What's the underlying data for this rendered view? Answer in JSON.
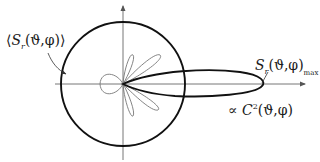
{
  "diagram": {
    "type": "polar-radiation-pattern",
    "labels": {
      "average": {
        "open": "⟨",
        "symbol": "S",
        "subscript": "r",
        "args": "(ϑ,φ)",
        "close": "⟩"
      },
      "maximum": {
        "symbol": "S",
        "subscript": "r",
        "args": "(ϑ,φ)",
        "suffix": "max"
      },
      "proportional": {
        "prefix": "∝ ",
        "symbol": "C",
        "superscript": "2",
        "args": "(ϑ,φ)"
      }
    },
    "elements": [
      "vertical-axis-with-arrow",
      "horizontal-axis-with-arrow",
      "average-power-circle",
      "main-lobe",
      "back-lobe",
      "upper-side-lobes",
      "lower-side-lobes",
      "leader-arrow-to-circle",
      "leader-line-to-main-lobe-tip"
    ],
    "colors": {
      "heavy_stroke": "#111111",
      "light_stroke": "#777777",
      "background": "#ffffff"
    }
  }
}
